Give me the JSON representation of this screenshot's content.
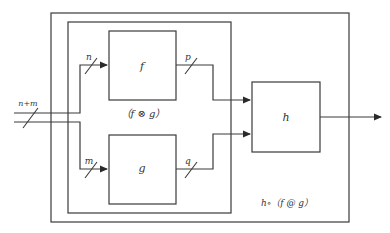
{
  "diagram": {
    "colors": {
      "stroke": "#3a3a3a",
      "text": "#333333",
      "background": "#ffffff"
    },
    "blocks": {
      "f": {
        "label": "f"
      },
      "g": {
        "label": "g"
      },
      "h": {
        "label": "h"
      }
    },
    "wires": {
      "input": {
        "label": "n+m"
      },
      "to_f": {
        "label": "n"
      },
      "to_g": {
        "label": "m"
      },
      "f_out": {
        "label": "p"
      },
      "g_out": {
        "label": "q"
      }
    },
    "groups": {
      "inner": {
        "label": "（f ⊗ g）"
      },
      "outer": {
        "label": "h∘（f @ g）"
      }
    }
  }
}
